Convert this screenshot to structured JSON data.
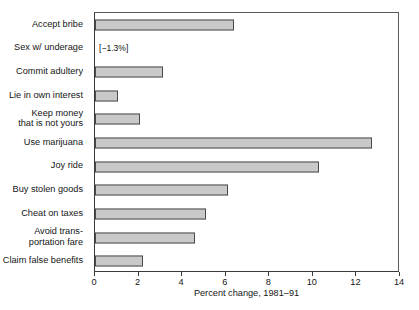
{
  "chart_data": {
    "type": "bar",
    "orientation": "horizontal",
    "title": "",
    "xlabel": "Percent change, 1981–91",
    "ylabel": "",
    "xlim": [
      0,
      14
    ],
    "xticks": [
      0,
      2,
      4,
      6,
      8,
      10,
      12,
      14
    ],
    "xtick_labels": [
      "0",
      "2",
      "4",
      "6",
      "8",
      "10",
      "12",
      "14"
    ],
    "grid": false,
    "legend": null,
    "categories": [
      "Accept bribe",
      "Sex w/ underage",
      "Commit adultery",
      "Lie in own interest",
      "Keep money\nthat is not yours",
      "Use marijuana",
      "Joy ride",
      "Buy stolen goods",
      "Cheat on taxes",
      "Avoid trans-\nportation fare",
      "Claim false benefits"
    ],
    "values": [
      6.4,
      -1.3,
      3.1,
      1.05,
      2.05,
      12.7,
      10.3,
      6.1,
      5.1,
      4.6,
      2.2
    ],
    "annotations": [
      {
        "category": "Sex w/ underage",
        "text": "[−1.3%]"
      }
    ],
    "colors": {
      "bar_fill": "#c9c9c9",
      "bar_edge": "#4a4a4a",
      "frame": "#3a3a3a",
      "text": "#151515",
      "background": "#ffffff"
    }
  }
}
